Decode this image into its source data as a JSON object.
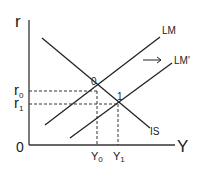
{
  "diagram": {
    "type": "IS-LM",
    "axes": {
      "y_label": "r",
      "x_label": "Y",
      "origin_label": "0"
    },
    "curves": [
      {
        "name": "IS",
        "label": "IS"
      },
      {
        "name": "LM",
        "label": "LM"
      },
      {
        "name": "LM'",
        "label": "LM'"
      }
    ],
    "points": [
      {
        "label": "0",
        "r_label": "r",
        "r_sub": "0",
        "y_label": "Y",
        "y_sub": "0"
      },
      {
        "label": "1",
        "r_label": "r",
        "r_sub": "1",
        "y_label": "Y",
        "y_sub": "1"
      }
    ],
    "shift_arrow": "→",
    "colors": {
      "line": "#222222",
      "dashed": "#333333"
    }
  }
}
